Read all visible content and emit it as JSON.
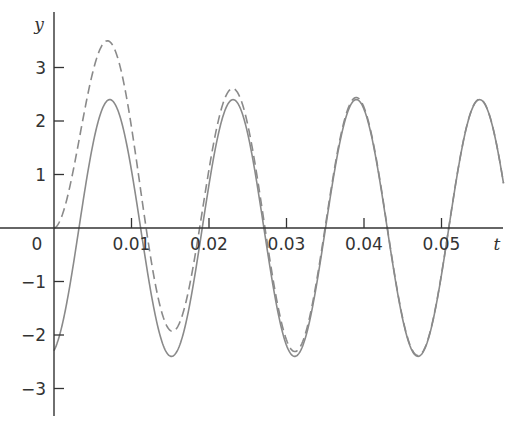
{
  "chart_data": {
    "type": "line",
    "title": "",
    "xlabel": "t",
    "ylabel": "y",
    "xlim": [
      0,
      0.058
    ],
    "ylim": [
      -3.5,
      3.8
    ],
    "grid": false,
    "legend": null,
    "x_ticks": [
      0,
      0.01,
      0.02,
      0.03,
      0.04,
      0.05
    ],
    "x_tick_labels": [
      "0",
      "0.01",
      "0.02",
      "0.03",
      "0.04",
      "0.05"
    ],
    "y_ticks": [
      -3,
      -2,
      -1,
      1,
      2,
      3
    ],
    "y_tick_labels": [
      "−3",
      "−2",
      "−1",
      "1",
      "2",
      "3"
    ],
    "series": [
      {
        "name": "steady-state",
        "style": "solid",
        "color": "#8a8a8a",
        "model": "2.4*sin(395*t - 1.273)",
        "x": [
          0,
          0.0072,
          0.0151,
          0.0231,
          0.031,
          0.0389,
          0.0468,
          0.0547,
          0.058
        ],
        "values": [
          -2.29,
          2.4,
          -2.4,
          2.4,
          -2.5,
          2.3,
          -2.55,
          2.3,
          0.8
        ]
      },
      {
        "name": "total-response",
        "style": "dashed",
        "color": "#8a8a8a",
        "model": "2.4*sin(395*t - 1.273) + 2.29*exp(-t/0.0096)",
        "x": [
          0,
          0.0072,
          0.0151,
          0.0231,
          0.031,
          0.0389,
          0.0468,
          0.0547,
          0.058
        ],
        "values": [
          0,
          3.48,
          -2.05,
          2.48,
          -2.42,
          2.4,
          -2.45,
          2.42,
          0.85
        ]
      }
    ]
  },
  "plot": {
    "origin_px": [
      54,
      228
    ],
    "px_per_x": 7750,
    "px_per_y": 53.5,
    "x_axis_end_px": 503,
    "y_axis_top_px": 12,
    "y_axis_bottom_px": 416
  }
}
